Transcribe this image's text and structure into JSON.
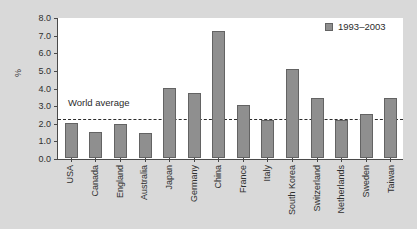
{
  "chart_data": {
    "type": "bar",
    "title": "",
    "xlabel": "",
    "ylabel": "%",
    "ylim": [
      0.0,
      8.0
    ],
    "yticks": [
      "0.0",
      "1.0",
      "2.0",
      "3.0",
      "4.0",
      "5.0",
      "6.0",
      "7.0",
      "8.0"
    ],
    "ytick_values": [
      0.0,
      1.0,
      2.0,
      3.0,
      4.0,
      5.0,
      6.0,
      7.0,
      8.0
    ],
    "grid": false,
    "legend_position": "top-right",
    "legend": [
      "1993–2003"
    ],
    "categories": [
      "USA",
      "Canada",
      "England",
      "Australia",
      "Japan",
      "Germany",
      "China",
      "France",
      "Italy",
      "South Korea",
      "Switzerland",
      "Netherlands",
      "Sweden",
      "Taiwan"
    ],
    "series": [
      {
        "name": "1993–2003",
        "values": [
          2.0,
          1.45,
          1.95,
          1.4,
          4.0,
          3.7,
          7.2,
          3.0,
          2.15,
          5.05,
          3.4,
          2.15,
          2.5,
          3.4
        ]
      }
    ],
    "annotations": [
      {
        "name": "world-average",
        "label": "World average",
        "value": 2.25,
        "style": "dashed-horizontal-line"
      }
    ],
    "colors": {
      "bar_fill": "#8f8f8f",
      "bar_border": "#636363",
      "axis": "#4a4a4a",
      "text": "#2f2f2f",
      "plot_background": "#ffffff",
      "figure_background": "#d9d9d9",
      "annotation_line": "#2b2b2b"
    }
  }
}
